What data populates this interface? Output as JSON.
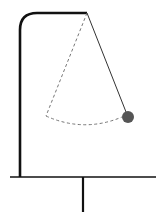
{
  "diagram": {
    "type": "pendulum",
    "colors": {
      "background": "#ffffff",
      "stand": "#111111",
      "string": "#333333",
      "dashed": "#777777",
      "bob": "#555555"
    },
    "stand": {
      "pole_x": 20,
      "pole_bottom_y": 177,
      "corner_radius": 17,
      "top_y": 13,
      "pivot_x": 87
    },
    "base": {
      "y": 177,
      "x1": 10,
      "x2": 156,
      "stem_x": 83,
      "stem_bottom_y": 212
    },
    "pendulum": {
      "pivot": [
        87,
        13
      ],
      "bob": [
        128,
        117
      ],
      "bob_radius": 6
    },
    "ghost": {
      "end": [
        46,
        116
      ],
      "arc_control": [
        84,
        133
      ]
    }
  }
}
